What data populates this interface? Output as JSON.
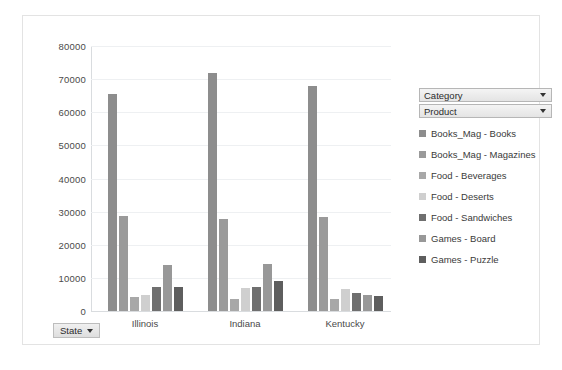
{
  "chart_data": {
    "type": "bar",
    "title": "",
    "xlabel": "",
    "ylabel": "",
    "grid": true,
    "legend_position": "right",
    "categories": [
      "Illinois",
      "Indiana",
      "Kentucky"
    ],
    "ylim": [
      0,
      80000
    ],
    "yticks": [
      "0",
      "10000",
      "20000",
      "30000",
      "40000",
      "50000",
      "60000",
      "70000",
      "80000"
    ],
    "ytick_values": [
      0,
      10000,
      20000,
      30000,
      40000,
      50000,
      60000,
      70000,
      80000
    ],
    "series": [
      {
        "name": "Books_Mag - Books",
        "color": "#8d8d8d",
        "values": [
          65500,
          72000,
          67800
        ]
      },
      {
        "name": "Books_Mag - Magazines",
        "color": "#9a9a9a",
        "values": [
          28600,
          27900,
          28500
        ]
      },
      {
        "name": "Food - Beverages",
        "color": "#a8a8a8",
        "values": [
          4300,
          3600,
          3500
        ]
      },
      {
        "name": "Food - Deserts",
        "color": "#cfcfcf",
        "values": [
          4700,
          7000,
          6500
        ]
      },
      {
        "name": "Food - Sandwiches",
        "color": "#6f6f6f",
        "values": [
          7300,
          7400,
          5400
        ]
      },
      {
        "name": "Games - Board",
        "color": "#989898",
        "values": [
          13900,
          14200,
          4800
        ]
      },
      {
        "name": "Games - Puzzle",
        "color": "#5e5e5e",
        "values": [
          7400,
          9100,
          4400
        ]
      }
    ]
  },
  "legend": {
    "filters": [
      {
        "label": "Category",
        "icon": "chevron-down-icon"
      },
      {
        "label": "Product",
        "icon": "chevron-down-icon"
      }
    ]
  },
  "slicer": {
    "state_label": "State",
    "icon": "chevron-down-icon"
  }
}
